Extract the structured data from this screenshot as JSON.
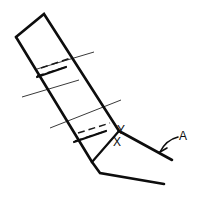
{
  "figure": {
    "background_color": "#ffffff",
    "line_color": "#0d0d0d",
    "width": 206,
    "height": 208
  },
  "labels": {
    "x": "X",
    "y": "Y",
    "a": "A"
  },
  "geometry": {
    "bar_top_left": "16,37",
    "bar_top_right": "44,14",
    "bar_right_edge_end": "119,131",
    "bar_left_edge_end": "92,162",
    "bend_vertex": "92,162",
    "upper_arm_end": "172,160",
    "lower_arm_end": "164,183",
    "x_point": "117,141",
    "y_point": "119,130"
  },
  "annotations": {
    "hidden_edges_count": 3,
    "centerlines_count": 3,
    "leader_target": "upper-arm-edge"
  }
}
